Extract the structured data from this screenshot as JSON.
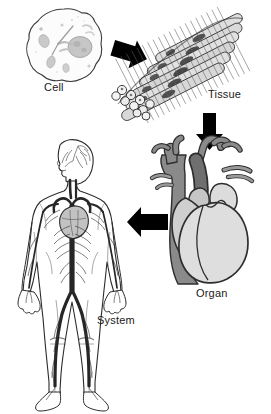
{
  "figure": {
    "background_color": "#ffffff",
    "ink_color": "#1a1a1a"
  },
  "labels": {
    "cell": "Cell",
    "tissue": "Tissue",
    "organ": "Organ",
    "system": "System"
  },
  "stages": [
    {
      "id": "cell",
      "label": "Cell",
      "caption_x": 44,
      "caption_y": 81,
      "description": "Irregular rounded cell with nucleus and organelles",
      "fill": "#fbfbfb",
      "organelle_fill": "#c9c9c9"
    },
    {
      "id": "tissue",
      "label": "Tissue",
      "caption_x": 208,
      "caption_y": 88,
      "description": "Bundle of striated muscle fibers",
      "fill": "#dcdcdc",
      "nucleus_fill": "#4a4a4a"
    },
    {
      "id": "organ",
      "label": "Organ",
      "caption_x": 196,
      "caption_y": 287,
      "description": "Human heart with great vessels",
      "vessel_fill": "#858585",
      "chamber_fill": "#d9d9d9"
    },
    {
      "id": "system",
      "label": "System",
      "caption_x": 97,
      "caption_y": 314,
      "description": "Whole human body showing the circulatory system",
      "body_fill": "#ffffff",
      "vessel_fill": "#2b2b2b"
    }
  ],
  "arrows": [
    {
      "id": "cell-to-tissue",
      "from": "cell",
      "to": "tissue",
      "direction": "down-right",
      "color": "#000000"
    },
    {
      "id": "tissue-to-organ",
      "from": "tissue",
      "to": "organ",
      "direction": "down",
      "color": "#000000"
    },
    {
      "id": "organ-to-system",
      "from": "organ",
      "to": "system",
      "direction": "left",
      "color": "#000000"
    }
  ],
  "colors": {
    "ink": "#1a1a1a",
    "light_gray": "#d9d9d9",
    "mid_gray": "#a8a8a8",
    "dark_gray": "#6e6e6e",
    "arrow": "#000000"
  }
}
